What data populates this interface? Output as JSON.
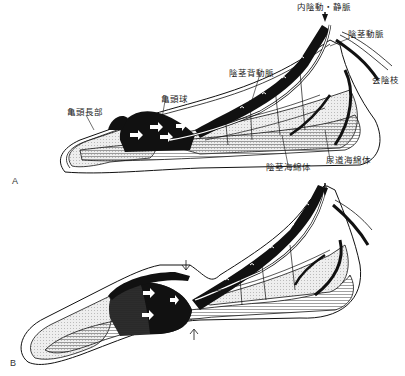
{
  "figure": {
    "panels": [
      {
        "id": "A",
        "letter": "A",
        "labels": {
          "internal_pudendal": "内陰動・静脈",
          "penile_artery": "陰茎動脈",
          "perineal_branch": "会陰枝",
          "dorsal_artery": "陰茎背動脈",
          "glans_distal": "亀頭長部",
          "glans_bulb": "亀頭球",
          "corpus_cavernosum": "陰茎海綿体",
          "corpus_spongiosum": "尿道海綿体"
        }
      },
      {
        "id": "B",
        "letter": "B"
      }
    ],
    "colors": {
      "ink": "#111111",
      "hatch": "#555555",
      "stipple": "#d9d9d9",
      "background": "#ffffff"
    }
  }
}
